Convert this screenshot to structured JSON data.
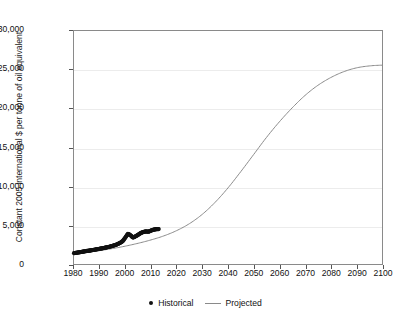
{
  "chart_data": {
    "type": "line",
    "title": "",
    "subtitle": "",
    "xlabel": "",
    "ylabel": "Constant 2005 international $ per tonne of oil equivalent",
    "xlim": [
      1980,
      2100
    ],
    "ylim": [
      0,
      30000
    ],
    "grid": true,
    "grid_axis": "y",
    "legend_position": "bottom-center",
    "x_ticks": [
      1980,
      1990,
      2000,
      2010,
      2020,
      2030,
      2040,
      2050,
      2060,
      2070,
      2080,
      2090,
      2100
    ],
    "x_tick_labels": [
      "1980",
      "1990",
      "2000",
      "2010",
      "2020",
      "2030",
      "2040",
      "2050",
      "2060",
      "2070",
      "2080",
      "2090",
      "2100"
    ],
    "y_ticks": [
      0,
      5000,
      10000,
      15000,
      20000,
      25000,
      30000
    ],
    "y_tick_labels": [
      "0",
      "5,000",
      "10,000",
      "15,000",
      "20,000",
      "25,000",
      "30,000"
    ],
    "series": [
      {
        "name": "Historical",
        "style": "markers",
        "marker": "circle",
        "color": "#111111",
        "x": [
          1980,
          1981,
          1982,
          1983,
          1984,
          1985,
          1986,
          1987,
          1988,
          1989,
          1990,
          1991,
          1992,
          1993,
          1994,
          1995,
          1996,
          1997,
          1998,
          1999,
          2000,
          2001,
          2002,
          2003,
          2004,
          2005,
          2006,
          2007,
          2008,
          2009,
          2010,
          2011,
          2012,
          2013
        ],
        "y": [
          1400,
          1450,
          1500,
          1560,
          1620,
          1680,
          1720,
          1780,
          1840,
          1900,
          1960,
          2020,
          2090,
          2160,
          2240,
          2330,
          2430,
          2560,
          2720,
          2950,
          3400,
          3900,
          3700,
          3400,
          3560,
          3760,
          3980,
          4120,
          4200,
          4150,
          4300,
          4420,
          4480,
          4500
        ]
      },
      {
        "name": "Projected",
        "style": "line",
        "color": "#8a8a8a",
        "x": [
          1980,
          1985,
          1990,
          1995,
          2000,
          2005,
          2010,
          2015,
          2020,
          2025,
          2030,
          2035,
          2040,
          2045,
          2050,
          2055,
          2060,
          2065,
          2070,
          2075,
          2080,
          2085,
          2090,
          2095,
          2100
        ],
        "y": [
          1300,
          1500,
          1720,
          1990,
          2300,
          2670,
          3100,
          3620,
          4300,
          5200,
          6400,
          7950,
          9800,
          11900,
          14100,
          16300,
          18300,
          20100,
          21700,
          23000,
          24000,
          24750,
          25250,
          25500,
          25600
        ]
      }
    ],
    "annotations": []
  },
  "legend": {
    "items": [
      {
        "label": "Historical",
        "marker": "dot-marker",
        "color": "#111111"
      },
      {
        "label": "Projected",
        "marker": "line-marker",
        "color": "#8a8a8a"
      }
    ]
  }
}
